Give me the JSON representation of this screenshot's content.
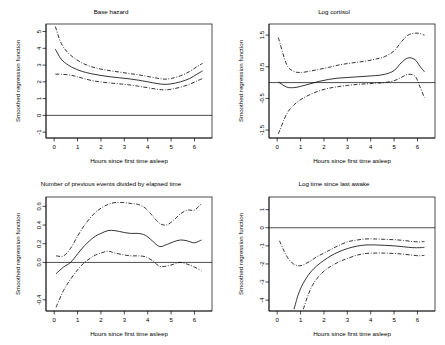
{
  "figure": {
    "background": "#ffffff",
    "line_color": "#000000",
    "panel_count": 4,
    "shared_xlabel": "Hours since first time asleep",
    "shared_ylabel": "Smoothed regression function"
  },
  "chart_data": [
    {
      "type": "line",
      "title": "Base hazard",
      "xlabel": "Hours since first time asleep",
      "ylabel": "Smoothed regression function",
      "xlim": [
        -0.35,
        6.75
      ],
      "ylim": [
        -1.35,
        5.45
      ],
      "xticks": [
        0,
        1,
        2,
        3,
        4,
        5,
        6
      ],
      "xtick_labels": [
        "0",
        "1",
        "2",
        "3",
        "4",
        "5",
        "6"
      ],
      "yticks": [
        -1,
        0,
        1,
        2,
        3,
        4,
        5
      ],
      "ytick_labels": [
        "-1",
        "0",
        "1",
        "2",
        "3",
        "4",
        "5"
      ],
      "grid": false,
      "legend": "none",
      "reference_line_y": 0,
      "series": [
        {
          "name": "estimate",
          "style": "solid",
          "x": [
            0.05,
            0.3,
            0.6,
            0.9,
            1.2,
            1.6,
            2.0,
            2.4,
            2.8,
            3.2,
            3.6,
            4.0,
            4.4,
            4.7,
            5.0,
            5.4,
            5.8,
            6.1,
            6.35
          ],
          "values": [
            3.95,
            3.35,
            3.0,
            2.78,
            2.62,
            2.48,
            2.38,
            2.3,
            2.24,
            2.18,
            2.1,
            2.0,
            1.9,
            1.85,
            1.88,
            2.0,
            2.2,
            2.45,
            2.65
          ]
        },
        {
          "name": "upper-confidence-band",
          "style": "dashdot",
          "x": [
            0.05,
            0.3,
            0.6,
            0.9,
            1.2,
            1.6,
            2.0,
            2.4,
            2.8,
            3.2,
            3.6,
            4.0,
            4.4,
            4.7,
            5.0,
            5.4,
            5.8,
            6.1,
            6.35
          ],
          "values": [
            5.3,
            4.3,
            3.72,
            3.38,
            3.12,
            2.9,
            2.76,
            2.66,
            2.58,
            2.5,
            2.42,
            2.32,
            2.22,
            2.16,
            2.2,
            2.36,
            2.62,
            2.9,
            3.1
          ]
        },
        {
          "name": "lower-confidence-band",
          "style": "dashdot",
          "x": [
            0.05,
            0.3,
            0.6,
            0.9,
            1.2,
            1.6,
            2.0,
            2.4,
            2.8,
            3.2,
            3.6,
            4.0,
            4.4,
            4.7,
            5.0,
            5.4,
            5.8,
            6.1,
            6.35
          ],
          "values": [
            2.46,
            2.45,
            2.42,
            2.34,
            2.22,
            2.08,
            1.99,
            1.93,
            1.88,
            1.82,
            1.74,
            1.65,
            1.56,
            1.52,
            1.56,
            1.68,
            1.86,
            2.05,
            2.2
          ]
        }
      ]
    },
    {
      "type": "line",
      "title": "Log cortisol",
      "xlabel": "Hours since first time asleep",
      "ylabel": "Smoothed regression function",
      "xlim": [
        -0.35,
        6.75
      ],
      "ylim": [
        -1.75,
        1.85
      ],
      "xticks": [
        0,
        1,
        2,
        3,
        4,
        5,
        6
      ],
      "xtick_labels": [
        "0",
        "1",
        "2",
        "3",
        "4",
        "5",
        "6"
      ],
      "yticks": [
        -1.5,
        -0.5,
        0.5,
        1.5
      ],
      "ytick_labels": [
        "-1.5",
        "-0.5",
        "0.5",
        "1.5"
      ],
      "grid": false,
      "legend": "none",
      "reference_line_y": 0,
      "series": [
        {
          "name": "estimate",
          "style": "solid",
          "x": [
            0.05,
            0.4,
            0.7,
            1.0,
            1.4,
            1.8,
            2.2,
            2.6,
            3.0,
            3.4,
            3.8,
            4.2,
            4.6,
            5.0,
            5.3,
            5.6,
            5.9,
            6.1,
            6.3
          ],
          "values": [
            0.02,
            -0.14,
            -0.16,
            -0.12,
            -0.04,
            0.04,
            0.1,
            0.14,
            0.16,
            0.18,
            0.2,
            0.22,
            0.26,
            0.38,
            0.62,
            0.78,
            0.72,
            0.52,
            0.34
          ]
        },
        {
          "name": "upper-confidence-band",
          "style": "dashdot",
          "x": [
            0.05,
            0.4,
            0.7,
            1.0,
            1.4,
            1.8,
            2.2,
            2.6,
            3.0,
            3.4,
            3.8,
            4.2,
            4.6,
            5.0,
            5.3,
            5.6,
            5.9,
            6.1,
            6.3
          ],
          "values": [
            1.42,
            0.58,
            0.36,
            0.32,
            0.36,
            0.42,
            0.48,
            0.55,
            0.6,
            0.64,
            0.68,
            0.74,
            0.82,
            1.0,
            1.28,
            1.5,
            1.56,
            1.55,
            1.5
          ]
        },
        {
          "name": "lower-confidence-band",
          "style": "dashdot",
          "x": [
            0.05,
            0.4,
            0.7,
            1.0,
            1.4,
            1.8,
            2.2,
            2.6,
            3.0,
            3.4,
            3.8,
            4.2,
            4.6,
            5.0,
            5.3,
            5.6,
            5.9,
            6.1,
            6.3
          ],
          "values": [
            -1.62,
            -1.0,
            -0.72,
            -0.54,
            -0.38,
            -0.26,
            -0.18,
            -0.13,
            -0.09,
            -0.06,
            -0.04,
            -0.02,
            0.0,
            0.06,
            0.16,
            0.26,
            0.2,
            -0.12,
            -0.48
          ]
        }
      ]
    },
    {
      "type": "line",
      "title": "Number of previous events divided by elapsed time",
      "xlabel": "Hours since first time asleep",
      "ylabel": "Smoothed regression function",
      "xlim": [
        -0.35,
        6.75
      ],
      "ylim": [
        -0.52,
        0.7
      ],
      "xticks": [
        0,
        1,
        2,
        3,
        4,
        5,
        6
      ],
      "xtick_labels": [
        "0",
        "1",
        "2",
        "3",
        "4",
        "5",
        "6"
      ],
      "yticks": [
        -0.4,
        0.0,
        0.2,
        0.4,
        0.6
      ],
      "ytick_labels": [
        "-0.4",
        "0.0",
        "0.2",
        "0.4",
        "0.6"
      ],
      "grid": false,
      "legend": "none",
      "reference_line_y": 0,
      "series": [
        {
          "name": "estimate",
          "style": "solid",
          "x": [
            0.08,
            0.4,
            0.7,
            1.0,
            1.3,
            1.7,
            2.0,
            2.3,
            2.6,
            3.0,
            3.3,
            3.6,
            3.9,
            4.2,
            4.5,
            4.8,
            5.1,
            5.4,
            5.7,
            6.0,
            6.3
          ],
          "values": [
            -0.12,
            -0.05,
            0.0,
            0.09,
            0.18,
            0.27,
            0.31,
            0.34,
            0.34,
            0.32,
            0.31,
            0.31,
            0.29,
            0.23,
            0.17,
            0.19,
            0.22,
            0.24,
            0.23,
            0.21,
            0.24
          ]
        },
        {
          "name": "upper-confidence-band",
          "style": "dashdot",
          "x": [
            0.08,
            0.4,
            0.7,
            1.0,
            1.3,
            1.7,
            2.0,
            2.3,
            2.6,
            3.0,
            3.3,
            3.6,
            3.9,
            4.2,
            4.5,
            4.8,
            5.1,
            5.4,
            5.7,
            6.0,
            6.3
          ],
          "values": [
            0.07,
            0.07,
            0.15,
            0.28,
            0.4,
            0.52,
            0.58,
            0.62,
            0.64,
            0.64,
            0.63,
            0.62,
            0.58,
            0.5,
            0.42,
            0.4,
            0.45,
            0.52,
            0.56,
            0.56,
            0.63
          ]
        },
        {
          "name": "lower-confidence-band",
          "style": "dashdot",
          "x": [
            0.08,
            0.4,
            0.7,
            1.0,
            1.3,
            1.7,
            2.0,
            2.3,
            2.6,
            3.0,
            3.3,
            3.6,
            3.9,
            4.2,
            4.5,
            4.8,
            5.1,
            5.4,
            5.7,
            6.0,
            6.3
          ],
          "values": [
            -0.48,
            -0.3,
            -0.18,
            -0.08,
            0.0,
            0.07,
            0.1,
            0.12,
            0.1,
            0.08,
            0.07,
            0.07,
            0.06,
            0.02,
            -0.04,
            -0.04,
            -0.02,
            0.0,
            -0.02,
            -0.05,
            -0.09
          ]
        }
      ]
    },
    {
      "type": "line",
      "title": "Log time since last awake",
      "xlabel": "Hours since first time asleep",
      "ylabel": "Smoothed regression function",
      "xlim": [
        -0.35,
        6.75
      ],
      "ylim": [
        -4.6,
        1.7
      ],
      "xticks": [
        0,
        1,
        2,
        3,
        4,
        5,
        6
      ],
      "xtick_labels": [
        "0",
        "1",
        "2",
        "3",
        "4",
        "5",
        "6"
      ],
      "yticks": [
        -4,
        -3,
        -2,
        -1,
        0,
        1
      ],
      "ytick_labels": [
        "-4",
        "-3",
        "-2",
        "-1",
        "0",
        "1"
      ],
      "grid": false,
      "legend": "none",
      "reference_line_y": 0,
      "series": [
        {
          "name": "estimate",
          "style": "solid",
          "x": [
            0.72,
            0.9,
            1.1,
            1.4,
            1.7,
            2.0,
            2.3,
            2.6,
            3.0,
            3.4,
            3.8,
            4.2,
            4.6,
            5.0,
            5.4,
            5.8,
            6.1,
            6.3
          ],
          "values": [
            -4.5,
            -3.7,
            -3.1,
            -2.5,
            -2.1,
            -1.8,
            -1.55,
            -1.35,
            -1.15,
            -1.02,
            -0.95,
            -0.95,
            -0.97,
            -1.0,
            -1.05,
            -1.1,
            -1.1,
            -1.08
          ]
        },
        {
          "name": "upper-confidence-band",
          "style": "dashdot",
          "x": [
            0.1,
            0.3,
            0.5,
            0.7,
            0.9,
            1.1,
            1.4,
            1.7,
            2.0,
            2.3,
            2.6,
            3.0,
            3.4,
            3.8,
            4.2,
            4.6,
            5.0,
            5.4,
            5.8,
            6.1,
            6.3
          ],
          "values": [
            -0.72,
            -1.3,
            -1.75,
            -2.0,
            -2.1,
            -2.06,
            -1.85,
            -1.6,
            -1.4,
            -1.2,
            -1.0,
            -0.78,
            -0.68,
            -0.62,
            -0.62,
            -0.64,
            -0.66,
            -0.7,
            -0.76,
            -0.78,
            -0.76
          ]
        },
        {
          "name": "lower-confidence-band",
          "style": "dashdot",
          "x": [
            1.12,
            1.3,
            1.5,
            1.8,
            2.1,
            2.4,
            2.7,
            3.0,
            3.4,
            3.8,
            4.2,
            4.6,
            5.0,
            5.4,
            5.8,
            6.1,
            6.3
          ],
          "values": [
            -4.5,
            -3.8,
            -3.2,
            -2.65,
            -2.3,
            -2.05,
            -1.85,
            -1.7,
            -1.52,
            -1.42,
            -1.4,
            -1.4,
            -1.42,
            -1.46,
            -1.52,
            -1.55,
            -1.52
          ]
        }
      ]
    }
  ]
}
